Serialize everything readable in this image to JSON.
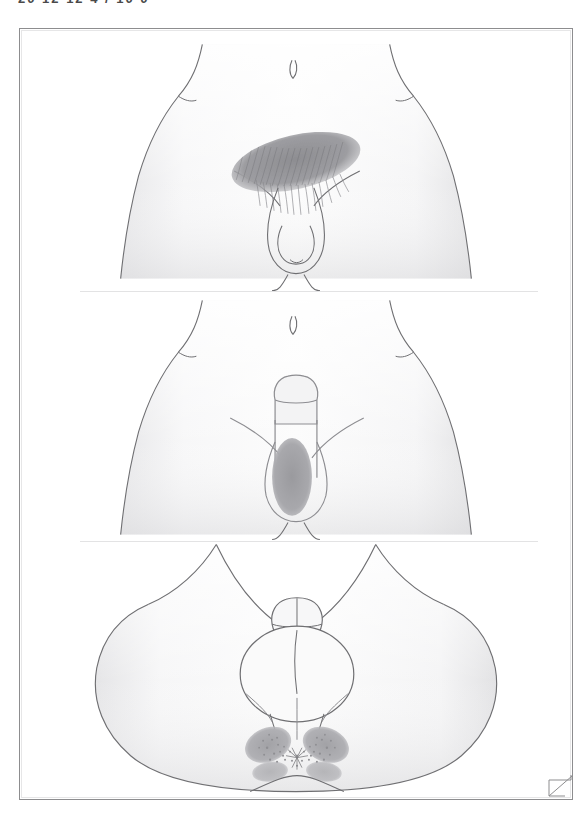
{
  "page": {
    "clipped_header_text": "20   12 12 4  / 10  0",
    "frame_color": "#8d8d8f",
    "background_color": "#ffffff",
    "corner_fold_label": "page-corner-fold"
  },
  "illustration": {
    "subject": "male external genitalia and perineum line drawings",
    "line_color": "#6f6f72",
    "skin_fill_light": "#fbfbfb",
    "skin_fill_mid": "#f1f1f2",
    "skin_fill_shadow": "#e4e4e6",
    "shading_gray": "#a5a5a8",
    "shading_gray_dark": "#8e8e92",
    "hair_stroke_color": "#8a8a8e",
    "stipple_color": "#9b9b9f"
  },
  "panels": [
    {
      "id": "panel-1",
      "name": "anterior-view-pubic-region",
      "view_label": "anterior view of lower abdomen and genitalia",
      "features": [
        "waist outline with flank notches",
        "umbilicus",
        "inguinal creases",
        "pubic hair patch shaded oval with hair strokes",
        "penis and scrotum outline",
        "medial thigh contours"
      ],
      "shaded_region_label": "pubic hair bearing area",
      "shaded_region_shape": "oblique oval"
    },
    {
      "id": "panel-2",
      "name": "anterior-view-shaved-shaft",
      "view_label": "anterior view with erect penis and shaded shaft region",
      "features": [
        "waist outline with flank notches",
        "umbilicus",
        "inguinal creases",
        "penis with glans outline",
        "vertical shaded oval on shaft base",
        "scrotum outline",
        "medial thigh contours"
      ],
      "shaded_region_label": "shaft and scrotal shading",
      "shaded_region_shape": "vertical oval"
    },
    {
      "id": "panel-3",
      "name": "perineal-lithotomy-view",
      "view_label": "perineal view in lithotomy position",
      "features": [
        "both thighs abducted forming wide V",
        "penis directed superiorly with glans",
        "scrotum rounded outline",
        "perineal raphe",
        "perianal butterfly shaded region with stippling",
        "anal verge",
        "gluteal cleft"
      ],
      "shaded_region_label": "perianal shaded region",
      "shaded_region_shape": "butterfly / bilateral wings with stipple"
    }
  ]
}
